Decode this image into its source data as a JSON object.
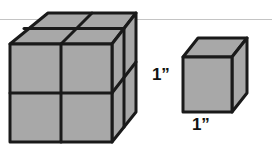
{
  "figure": {
    "background_color": "#FFFFFF",
    "face_fill": "#A8A8A8",
    "edge_color": "#1A1A1A",
    "horizon_line_color": "#BFBFBF",
    "label_color": "#111111",
    "large_block": {
      "name": "large-block",
      "description": "Large rectangular solid composed of unit cubes",
      "cubes_across": 2,
      "cubes_high": 2,
      "cubes_deep": 2,
      "total_unit_cubes": 8
    },
    "unit_cube": {
      "name": "unit-cube",
      "description": "Single reference cube",
      "edge_length": 1,
      "units": "inch"
    },
    "labels": {
      "height_label": "1”",
      "width_label": "1”"
    }
  }
}
